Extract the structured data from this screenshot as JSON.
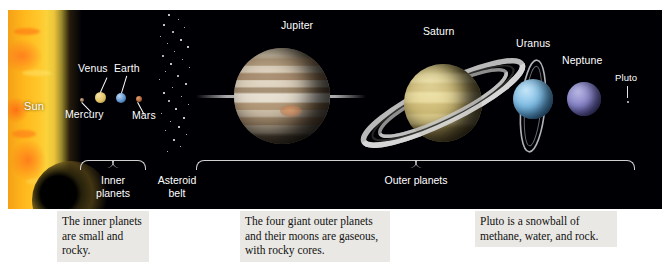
{
  "diagram": {
    "background_color": "#000004",
    "sun": {
      "label": "Sun",
      "color": "#ffc62a"
    },
    "inner_planets": {
      "group_label": "Inner\nplanets",
      "bodies": [
        {
          "name": "Mercury",
          "label": "Mercury",
          "color": "#9a7a5a",
          "diameter_px": 4
        },
        {
          "name": "Venus",
          "label": "Venus",
          "color": "#e8c96a",
          "diameter_px": 11
        },
        {
          "name": "Earth",
          "label": "Earth",
          "color": "#6f9ed6",
          "diameter_px": 10
        },
        {
          "name": "Mars",
          "label": "Mars",
          "color": "#b9724a",
          "diameter_px": 6
        }
      ]
    },
    "asteroid_belt": {
      "group_label": "Asteroid\nbelt",
      "dot_color": "#e7e7e7"
    },
    "outer_planets": {
      "group_label": "Outer planets",
      "bodies": [
        {
          "name": "Jupiter",
          "label": "Jupiter",
          "color": "#cbb79a",
          "diameter_px": 96,
          "has_rings": true
        },
        {
          "name": "Saturn",
          "label": "Saturn",
          "color": "#d8c87a",
          "diameter_px": 78,
          "has_rings": true
        },
        {
          "name": "Uranus",
          "label": "Uranus",
          "color": "#79b6e4",
          "diameter_px": 40,
          "has_rings": true
        },
        {
          "name": "Neptune",
          "label": "Neptune",
          "color": "#7b7fc4",
          "diameter_px": 34,
          "has_rings": false
        }
      ]
    },
    "pluto": {
      "label": "Pluto",
      "color": "#cfcfcf",
      "diameter_px": 2,
      "pointer": "down-arrow"
    },
    "captions": [
      {
        "id": "inner",
        "text": "The inner planets are small and rocky."
      },
      {
        "id": "outer",
        "text": "The four giant outer planets and their moons are gaseous, with rocky cores."
      },
      {
        "id": "pluto",
        "text": "Pluto is a snowball of methane, water, and rock."
      }
    ]
  }
}
